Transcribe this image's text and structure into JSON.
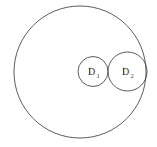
{
  "figure": {
    "type": "geometric-diagram",
    "background_color": "#ffffff",
    "stroke_color": "#4a4a4a",
    "label_color": "#3a3a3a"
  },
  "shapes": {
    "outer_circle": {
      "name": "outer-circle",
      "cx": 80,
      "cy": 72,
      "r": 66,
      "label": ""
    },
    "circle_d1": {
      "name": "circle-d1",
      "cx": 93,
      "cy": 71.5,
      "r": 15,
      "label": "D",
      "subscript": "1"
    },
    "circle_d2": {
      "name": "circle-d2",
      "cx": 127.5,
      "cy": 71.5,
      "r": 19.5,
      "label": "D",
      "subscript": "2"
    }
  },
  "labels": {
    "d1": {
      "text": "D",
      "subscript": "1",
      "x": 88,
      "y": 75,
      "sub_x": 96.5,
      "sub_y": 77.5
    },
    "d2": {
      "text": "D",
      "subscript": "2",
      "x": 122,
      "y": 75,
      "sub_x": 130.5,
      "sub_y": 77.5
    }
  }
}
